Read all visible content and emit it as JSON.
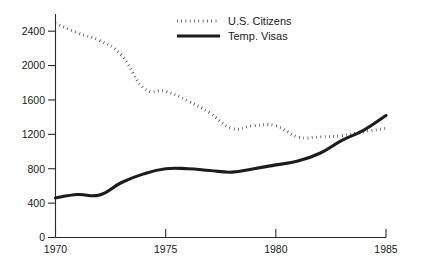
{
  "chart_data": {
    "type": "line",
    "title": "",
    "subtitle": "",
    "xlabel": "",
    "ylabel": "",
    "xlim": [
      1970,
      1985
    ],
    "ylim": [
      0,
      2600
    ],
    "grid": false,
    "legend_position": "top-center",
    "x": [
      1970,
      1971,
      1972,
      1973,
      1974,
      1975,
      1976,
      1977,
      1978,
      1979,
      1980,
      1981,
      1982,
      1983,
      1984,
      1985
    ],
    "xticks": [
      1970,
      1975,
      1980,
      1985
    ],
    "xticklabels": [
      "1970",
      "1975",
      "1980",
      "1985"
    ],
    "yticks": [
      0,
      400,
      800,
      1200,
      1600,
      2000,
      2400
    ],
    "yticklabels": [
      "0",
      "400",
      "800",
      "1200",
      "1600",
      "2000",
      "2400"
    ],
    "series": [
      {
        "name": "U.S. Citizens",
        "style": "dotted",
        "color": "#1c1c1c",
        "values": [
          2490,
          2380,
          2290,
          2120,
          1740,
          1700,
          1590,
          1450,
          1270,
          1300,
          1300,
          1170,
          1170,
          1185,
          1230,
          1270
        ]
      },
      {
        "name": "Temp. Visas",
        "style": "solid",
        "color": "#1c1c1c",
        "values": [
          460,
          500,
          495,
          640,
          740,
          800,
          800,
          780,
          760,
          800,
          845,
          890,
          980,
          1130,
          1250,
          1420
        ]
      }
    ]
  },
  "legend": {
    "entries": [
      {
        "label": "U.S. Citizens",
        "style": "dotted"
      },
      {
        "label": "Temp. Visas",
        "style": "solid"
      }
    ]
  },
  "axes": {
    "y_tick_labels": [
      "2400",
      "2000",
      "1600",
      "1200",
      "800",
      "400",
      "0"
    ],
    "x_tick_labels": [
      "1970",
      "1975",
      "1980",
      "1985"
    ]
  },
  "colors": {
    "ink": "#1c1c1c",
    "axis": "#2b2b2b",
    "background": "#ffffff"
  }
}
